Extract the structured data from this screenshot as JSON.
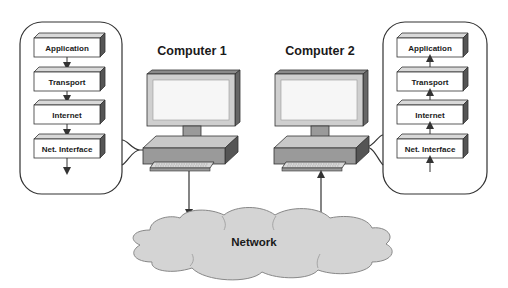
{
  "computers": [
    {
      "id": "computer-1",
      "label": "Computer 1"
    },
    {
      "id": "computer-2",
      "label": "Computer 2"
    }
  ],
  "stacks": {
    "left": {
      "layers": [
        "Application",
        "Transport",
        "Internet",
        "Net. Interface"
      ],
      "direction": "down"
    },
    "right": {
      "layers": [
        "Application",
        "Transport",
        "Internet",
        "Net. Interface"
      ],
      "direction": "up"
    }
  },
  "network": {
    "label": "Network"
  },
  "colors": {
    "box_face": "#ffffff",
    "box_top": "#d9d9d9",
    "box_side": "#555555",
    "monitor_frame": "#cfcfcf",
    "monitor_top": "#8a8a8a",
    "monitor_side": "#666666",
    "base_front": "#9a9a9a",
    "base_top": "#c8c8c8",
    "keyboard": "#d0d0d0",
    "cloud": "#d4d4d4",
    "stroke": "#333333"
  }
}
